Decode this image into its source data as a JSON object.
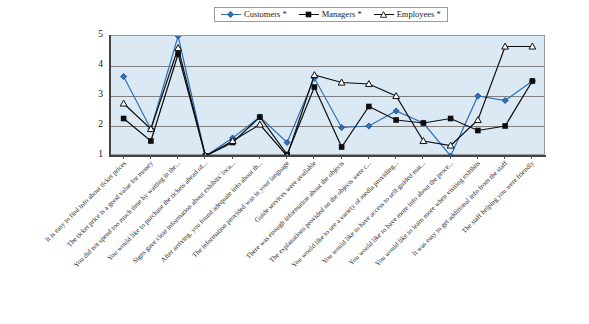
{
  "legend": {
    "position": "top-center",
    "entries": [
      {
        "label": "Customers *",
        "color": "#2f6fb5",
        "marker": "diamond",
        "name": "legend-item-customers"
      },
      {
        "label": "Managers *",
        "color": "#0d0d0d",
        "marker": "square",
        "name": "legend-item-managers"
      },
      {
        "label": "Employees *",
        "color": "#0d0d0d",
        "marker": "triangle-open",
        "name": "legend-item-employees"
      }
    ]
  },
  "axes": {
    "y_ticks": [
      "5",
      "4",
      "3",
      "2",
      "1"
    ],
    "y_min": 1,
    "y_max": 5,
    "grid": true
  },
  "chart_data": {
    "type": "line",
    "title": "",
    "xlabel": "",
    "ylabel": "",
    "ylim": [
      1,
      5
    ],
    "grid": true,
    "legend_position": "top-center",
    "categories": [
      "It is easy to find info about ticket prices",
      "The ticket price is a good value for money",
      "You did not spend too much time by waiting in the...",
      "You would like to purchase the tickets ahead of...",
      "Signs gave clear information about exhibits' loca...",
      "After arriving, you found adequate info about th...",
      "The information provided was in your language",
      "Guide services were available",
      "There was enough information about the objects",
      "The explanations provided on the objects were c...",
      "You would like to see a variety of media providing...",
      "You would like to have access to self-guided mat...",
      "You would like to have more info about the proce...",
      "You would like to learn more when visiting exhibits",
      "It was easy to get additional info from the staff",
      "The staff helping you were friendly"
    ],
    "series": [
      {
        "name": "Customers *",
        "color": "#2f6fb5",
        "marker": "diamond",
        "values": [
          3.65,
          1.9,
          5.0,
          1.0,
          1.6,
          2.3,
          1.45,
          3.6,
          1.95,
          2.0,
          2.5,
          2.1,
          1.0,
          3.0,
          2.85,
          3.5
        ]
      },
      {
        "name": "Managers *",
        "color": "#0d0d0d",
        "marker": "square",
        "values": [
          2.25,
          1.5,
          4.4,
          1.0,
          1.45,
          2.3,
          1.05,
          3.3,
          1.3,
          2.65,
          2.2,
          2.1,
          2.25,
          1.85,
          2.0,
          3.5
        ]
      },
      {
        "name": "Employees *",
        "color": "#0d0d0d",
        "marker": "triangle-open",
        "values": [
          2.75,
          1.9,
          4.6,
          1.0,
          1.5,
          2.05,
          1.0,
          3.7,
          3.45,
          3.4,
          3.0,
          1.5,
          1.35,
          2.2,
          4.65,
          4.65
        ]
      }
    ]
  },
  "colors": {
    "plot_background": "#dbe9f5",
    "gridline": "#808080",
    "frame": "#9a9a9a",
    "customers": "#2f6fb5",
    "managers": "#0d0d0d",
    "employees": "#0d0d0d"
  }
}
